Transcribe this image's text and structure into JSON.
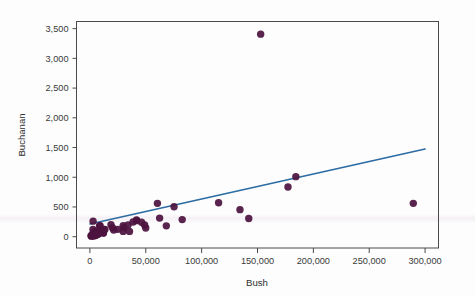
{
  "chart_data": {
    "type": "scatter",
    "title": "",
    "xlabel": "Bush",
    "ylabel": "Buchanan",
    "xlim": [
      -12000,
      312000
    ],
    "ylim": [
      -190,
      3620
    ],
    "grid": false,
    "legend": null,
    "xticks": [
      0,
      50000,
      100000,
      150000,
      200000,
      250000,
      300000
    ],
    "xticklabels": [
      "0",
      "50,000",
      "100,000",
      "150,000",
      "200,000",
      "250,000",
      "300,000"
    ],
    "yticks": [
      0,
      500,
      1000,
      1500,
      2000,
      2500,
      3000,
      3500
    ],
    "yticklabels": [
      "0",
      "500",
      "1,000",
      "1,500",
      "2,000",
      "2,500",
      "3,000",
      "3,500"
    ],
    "marker_color": "#4c1340",
    "marker_size": 5.2,
    "series": [
      {
        "name": "Counties",
        "x": [
          2873,
          5610,
          38637,
          5413,
          2750,
          35426,
          29765,
          41736,
          9138,
          12176,
          29744,
          6860,
          4256,
          41745,
          177279,
          2697,
          142183,
          9048,
          30646,
          4985,
          2455,
          34124,
          12173,
          3300,
          4567,
          115185,
          7244,
          68390,
          12126,
          4045,
          5058,
          24832,
          2326,
          20196,
          12060,
          6962,
          1316,
          7671,
          49963,
          5059,
          4276,
          152846,
          3038,
          289456,
          5816,
          7101,
          21271,
          4512,
          12028,
          3704,
          82602,
          75293,
          3226,
          8649,
          3743,
          46195,
          60424,
          134310,
          2356,
          4511,
          184312,
          62410,
          1010,
          48973,
          13439,
          5414,
          18850
        ],
        "y": [
          262,
          73,
          248,
          65,
          122,
          89,
          186,
          270,
          186,
          120,
          89,
          60,
          36,
          282,
          836,
          19,
          305,
          120,
          153,
          41,
          47,
          196,
          107,
          55,
          90,
          570,
          42,
          183,
          63,
          29,
          73,
          124,
          22,
          151,
          118,
          76,
          9,
          49,
          147,
          21,
          39,
          3407,
          30,
          561,
          38,
          69,
          113,
          39,
          64,
          32,
          288,
          504,
          12,
          182,
          35,
          242,
          561,
          455,
          24,
          26,
          1010,
          313,
          17,
          198,
          120,
          29,
          200
        ]
      }
    ],
    "trendline": {
      "type": "linear",
      "color": "#2b6ca3",
      "width": 1.6,
      "x_start": 0,
      "x_end": 300000,
      "y_start": 215,
      "y_end": 1475,
      "slope": 0.0042,
      "intercept": 215
    }
  },
  "axis": {
    "x_title": "Bush",
    "y_title": "Buchanan"
  }
}
